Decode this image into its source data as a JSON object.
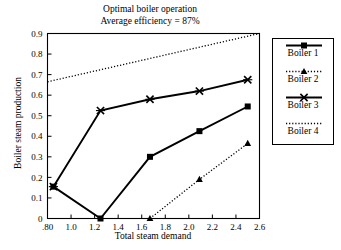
{
  "chart_data": {
    "type": "line",
    "title": "Optimal boiler operation",
    "subtitle": "Average efficiency = 87%",
    "xlabel": "Total steam demand",
    "ylabel": "Boiler steam production",
    "xlim": [
      0.8,
      2.6
    ],
    "ylim": [
      0,
      0.9
    ],
    "grid": false,
    "legend_position": "right",
    "xticks": [
      0.8,
      1.0,
      1.2,
      1.4,
      1.6,
      1.8,
      2.0,
      2.2,
      2.4,
      2.6
    ],
    "xticklabels": [
      ".80",
      "1.0",
      "1.2",
      "1.4",
      "1.6",
      "1.8",
      "2.0",
      "2.2",
      "2.4",
      "2.6"
    ],
    "yticks": [
      0,
      0.1,
      0.2,
      0.3,
      0.4,
      0.5,
      0.6,
      0.7,
      0.8,
      0.9
    ],
    "yticklabels": [
      "0",
      "0.1",
      "0.2",
      "0.3",
      "0.4",
      "0.5",
      "0.6",
      "0.7",
      "0.8",
      "0.9"
    ],
    "series": [
      {
        "name": "Boiler 1",
        "marker": "square",
        "linestyle": "solid",
        "color": "#000000",
        "x": [
          0.85,
          1.25,
          1.67,
          2.09,
          2.5
        ],
        "y": [
          0.155,
          0.0,
          0.3,
          0.425,
          0.545
        ]
      },
      {
        "name": "Boiler 2",
        "marker": "triangle",
        "linestyle": "dotted",
        "color": "#000000",
        "x": [
          1.67,
          2.09,
          2.5
        ],
        "y": [
          0.0,
          0.19,
          0.365
        ]
      },
      {
        "name": "Boiler 3",
        "marker": "x",
        "linestyle": "solid",
        "color": "#000000",
        "x": [
          0.85,
          1.25,
          1.67,
          2.09,
          2.5
        ],
        "y": [
          0.155,
          0.525,
          0.58,
          0.62,
          0.675
        ]
      },
      {
        "name": "Boiler 4",
        "marker": "none",
        "linestyle": "dotted",
        "color": "#000000",
        "x": [
          0.8,
          2.6
        ],
        "y": [
          0.665,
          0.9
        ]
      }
    ]
  },
  "legend": {
    "entries": [
      {
        "label": "Boiler 1"
      },
      {
        "label": "Boiler 2"
      },
      {
        "label": "Boiler 3"
      },
      {
        "label": "Boiler 4"
      }
    ]
  }
}
